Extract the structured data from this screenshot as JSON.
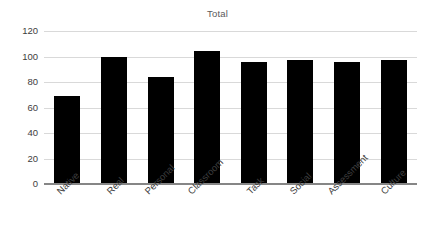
{
  "chart_data": {
    "type": "bar",
    "title": "Total",
    "xlabel": "",
    "ylabel": "",
    "categories": [
      "Native",
      "Real",
      "Personal",
      "Classroom",
      "Task",
      "Social",
      "Assessment",
      "Culture"
    ],
    "values": [
      69,
      100,
      84,
      104,
      96,
      97,
      96,
      97
    ],
    "ylim": [
      0,
      120
    ],
    "yticks": [
      0,
      20,
      40,
      60,
      80,
      100,
      120
    ],
    "ytick_labels": [
      "0",
      "20",
      "40",
      "60",
      "80",
      "100",
      "120"
    ],
    "grid": true,
    "grid_axis": "y",
    "legend": false,
    "legend_position": "none",
    "bar_color": "#000000",
    "gridline_color": "#d9d9d9",
    "axis_color": "#868686",
    "title_color": "#5a5a5a",
    "tick_label_color": "#3d3d3d",
    "background_color": "#ffffff",
    "xtick_rotation": -45
  }
}
